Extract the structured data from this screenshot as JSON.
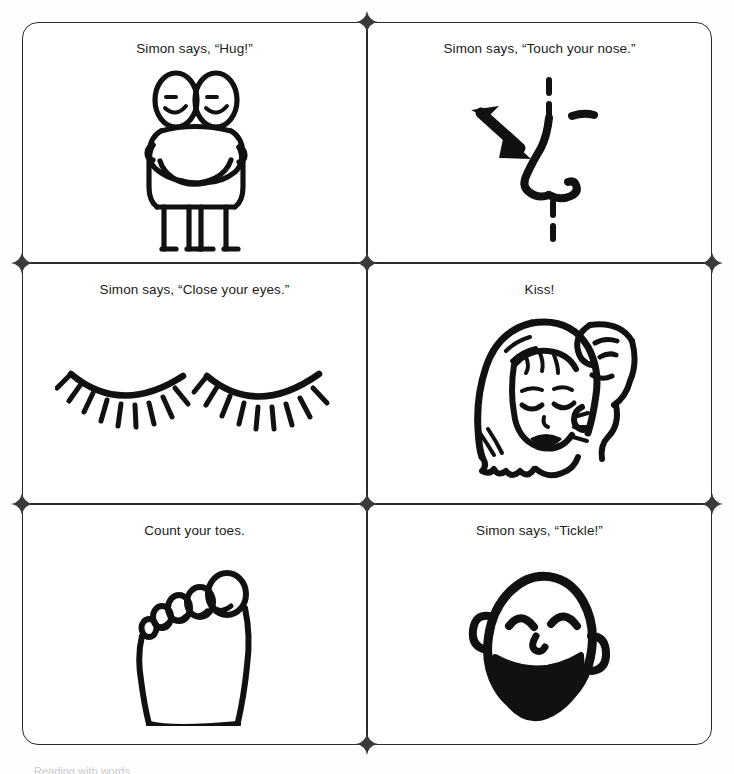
{
  "page": {
    "background_color": "#ffffff",
    "ink_color": "#1a1a1a",
    "columns": 2,
    "rows": 3,
    "footer_text": "Reading with words"
  },
  "cards": [
    {
      "id": "hug",
      "caption": "Simon says, “Hug!”",
      "illustration": "two-people-hugging-illustration",
      "illustration_description": "Two stick-style figures with oval heads and smiling faces embracing each other"
    },
    {
      "id": "touch-nose",
      "caption": "Simon says, “Touch your nose.”",
      "illustration": "nose-with-arrow-illustration",
      "illustration_description": "Profile of a nose drawn with a dashed face outline and a solid arrow pointing at it"
    },
    {
      "id": "close-eyes",
      "caption": "Simon says, “Close your eyes.”",
      "illustration": "closed-eyes-illustration",
      "illustration_description": "A pair of closed eyes drawn as curved lids with eyelashes"
    },
    {
      "id": "kiss",
      "caption": "Kiss!",
      "illustration": "kiss-on-cheek-illustration",
      "illustration_description": "A woman with long hair and closed eyes being kissed on the cheek by a man behind her"
    },
    {
      "id": "count-toes",
      "caption": "Count your toes.",
      "illustration": "foot-with-toes-illustration",
      "illustration_description": "Outline of a bare foot seen from above showing five toes"
    },
    {
      "id": "tickle",
      "caption": "Simon says, “Tickle!”",
      "illustration": "laughing-face-illustration",
      "illustration_description": "A laughing face with squinted happy eyes, ears and a wide open mouth"
    }
  ],
  "cut_marks": {
    "name": "cut-registration-mark",
    "count": 8,
    "shape": "four-pointed-star",
    "color": "#3a3a3a"
  }
}
